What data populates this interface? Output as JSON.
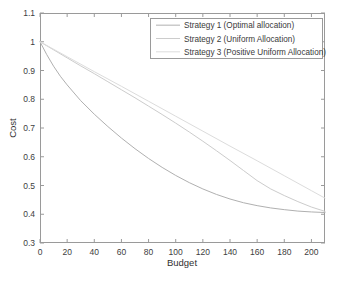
{
  "figure": {
    "background": "#ffffff",
    "axes_color": "#9a9a9a",
    "plot_box": {
      "left": 40,
      "top": 13,
      "right": 325,
      "bottom": 243
    }
  },
  "chart_data": {
    "type": "line",
    "title": "",
    "xlabel": "Budget",
    "ylabel": "Cost",
    "xlim": [
      0,
      210
    ],
    "ylim": [
      0.3,
      1.1
    ],
    "xticks": [
      0,
      20,
      40,
      60,
      80,
      100,
      120,
      140,
      160,
      180,
      200
    ],
    "xtick_labels": [
      "0",
      "20",
      "40",
      "60",
      "80",
      "100",
      "120",
      "140",
      "160",
      "180",
      "200"
    ],
    "yticks": [
      0.3,
      0.4,
      0.5,
      0.6,
      0.7,
      0.8,
      0.9,
      1,
      1.1
    ],
    "ytick_labels": [
      "0.3",
      "0.4",
      "0.5",
      "0.6",
      "0.7",
      "0.8",
      "0.9",
      "1",
      "1.1"
    ],
    "grid": false,
    "legend_position": "top-right",
    "series": [
      {
        "name": "Strategy 1 (Optimal allocation)",
        "color": "#b0b0b0",
        "x": [
          0,
          5,
          10,
          15,
          20,
          30,
          40,
          50,
          60,
          70,
          80,
          90,
          100,
          110,
          120,
          130,
          140,
          150,
          160,
          170,
          180,
          190,
          200,
          210
        ],
        "y": [
          1.0,
          0.955,
          0.915,
          0.88,
          0.85,
          0.795,
          0.748,
          0.705,
          0.665,
          0.628,
          0.594,
          0.563,
          0.535,
          0.51,
          0.488,
          0.469,
          0.453,
          0.44,
          0.43,
          0.422,
          0.416,
          0.411,
          0.408,
          0.406
        ]
      },
      {
        "name": "Strategy 2 (Uniform Allocation)",
        "color": "#cccccc",
        "x": [
          0,
          10,
          20,
          30,
          40,
          50,
          60,
          70,
          80,
          90,
          100,
          110,
          120,
          130,
          140,
          150,
          160,
          170,
          180,
          190,
          200,
          210
        ],
        "y": [
          1.0,
          0.972,
          0.944,
          0.916,
          0.889,
          0.861,
          0.833,
          0.805,
          0.776,
          0.747,
          0.717,
          0.686,
          0.654,
          0.621,
          0.587,
          0.552,
          0.517,
          0.488,
          0.465,
          0.444,
          0.425,
          0.41
        ]
      },
      {
        "name": "Strategy 3 (Positive Uniform Allocation)",
        "color": "#dcdcdc",
        "x": [
          0,
          20,
          40,
          60,
          80,
          100,
          120,
          140,
          160,
          180,
          200,
          210
        ],
        "y": [
          1.0,
          0.948,
          0.896,
          0.845,
          0.793,
          0.741,
          0.689,
          0.637,
          0.586,
          0.534,
          0.482,
          0.456
        ]
      }
    ]
  },
  "legend": {
    "entries": [
      {
        "label": "Strategy 1 (Optimal allocation)",
        "color": "#b0b0b0"
      },
      {
        "label": "Strategy 2 (Uniform Allocation)",
        "color": "#cccccc"
      },
      {
        "label": "Strategy 3 (Positive Uniform Allocation)",
        "color": "#dcdcdc"
      }
    ],
    "box": {
      "x": 150,
      "y": 18,
      "width": 172,
      "height": 40
    },
    "border_color": "#9a9a9a",
    "background": "#ffffff"
  }
}
